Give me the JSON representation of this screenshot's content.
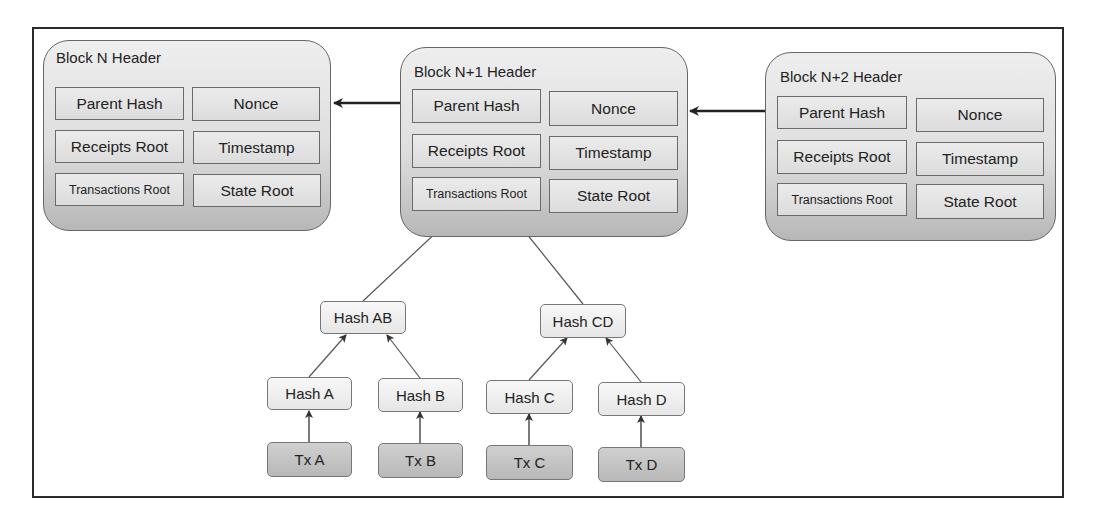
{
  "diagram": {
    "blocks": [
      {
        "title": "Block N Header",
        "fields": {
          "parent_hash": "Parent Hash",
          "nonce": "Nonce",
          "receipts_root": "Receipts Root",
          "timestamp": "Timestamp",
          "transactions_root": "Transactions Root",
          "state_root": "State Root"
        }
      },
      {
        "title": "Block N+1 Header",
        "fields": {
          "parent_hash": "Parent Hash",
          "nonce": "Nonce",
          "receipts_root": "Receipts Root",
          "timestamp": "Timestamp",
          "transactions_root": "Transactions Root",
          "state_root": "State Root"
        }
      },
      {
        "title": "Block N+2 Header",
        "fields": {
          "parent_hash": "Parent Hash",
          "nonce": "Nonce",
          "receipts_root": "Receipts Root",
          "timestamp": "Timestamp",
          "transactions_root": "Transactions Root",
          "state_root": "State Root"
        }
      }
    ],
    "merkle_tree": {
      "level1": [
        "Hash AB",
        "Hash CD"
      ],
      "level2": [
        "Hash A",
        "Hash B",
        "Hash C",
        "Hash D"
      ],
      "transactions": [
        "Tx A",
        "Tx B",
        "Tx C",
        "Tx D"
      ]
    },
    "edges": [
      {
        "from": "Block N+1 Header",
        "to": "Block N Header"
      },
      {
        "from": "Block N+2 Header",
        "to": "Block N+1 Header"
      },
      {
        "from": "Hash AB",
        "to": "Block N+1 Header.Transactions Root"
      },
      {
        "from": "Hash CD",
        "to": "Block N+1 Header.Transactions Root"
      },
      {
        "from": "Hash A",
        "to": "Hash AB"
      },
      {
        "from": "Hash B",
        "to": "Hash AB"
      },
      {
        "from": "Hash C",
        "to": "Hash CD"
      },
      {
        "from": "Hash D",
        "to": "Hash CD"
      },
      {
        "from": "Tx A",
        "to": "Hash A"
      },
      {
        "from": "Tx B",
        "to": "Hash B"
      },
      {
        "from": "Tx C",
        "to": "Hash C"
      },
      {
        "from": "Tx D",
        "to": "Hash D"
      }
    ],
    "colors": {
      "block_fill_top": "#eeeeee",
      "block_fill_bottom": "#b7b7b7",
      "tx_fill": "#c4c4c4",
      "hash_fill": "#f2f2f2",
      "line": "#333333"
    }
  }
}
